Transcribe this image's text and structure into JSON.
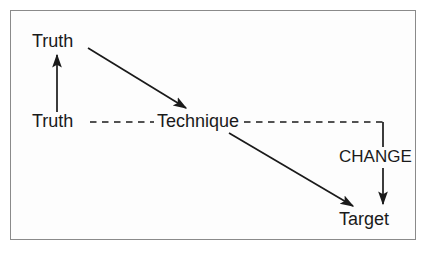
{
  "diagram": {
    "background_color": "#fdfdfd",
    "border_color": "#8a8a8a",
    "ink_color": "#1a1a1a",
    "nodes": [
      {
        "id": "truth_top",
        "label": "Truth",
        "x": 58,
        "y": 41
      },
      {
        "id": "truth_left",
        "label": "Truth",
        "x": 58,
        "y": 121
      },
      {
        "id": "technique",
        "label": "Technique",
        "x": 199,
        "y": 121
      },
      {
        "id": "change",
        "label": "CHANGE",
        "x": 377,
        "y": 157
      },
      {
        "id": "target",
        "label": "Target",
        "x": 369,
        "y": 219
      }
    ],
    "edges": [
      {
        "id": "truth-left-to-truth-top",
        "from": "truth_left",
        "to": "truth_top",
        "style": "solid",
        "arrow": "end",
        "direction": "up"
      },
      {
        "id": "truth-top-to-technique",
        "from": "truth_top",
        "to": "technique",
        "style": "solid",
        "arrow": "end",
        "direction": "down-right"
      },
      {
        "id": "truth-left-to-technique",
        "from": "truth_left",
        "to": "technique",
        "style": "dashed",
        "arrow": "none",
        "direction": "right"
      },
      {
        "id": "technique-to-change",
        "from": "technique",
        "to": "change",
        "style": "dashed",
        "arrow": "none",
        "direction": "right-then-down"
      },
      {
        "id": "technique-to-target",
        "from": "technique",
        "to": "target",
        "style": "solid",
        "arrow": "end",
        "direction": "down-right"
      },
      {
        "id": "change-to-target",
        "from": "change",
        "to": "target",
        "style": "solid",
        "arrow": "end",
        "direction": "down"
      }
    ]
  }
}
